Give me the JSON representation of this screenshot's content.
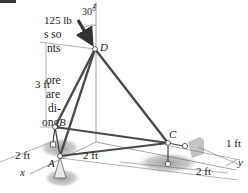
{
  "figure": {
    "force_label": "125 lb",
    "angle_label": "30°",
    "points": {
      "A": "A",
      "B": "B",
      "C": "C",
      "D": "D"
    },
    "axes": {
      "x": "x",
      "y": "y",
      "z": "z"
    },
    "dimensions": {
      "height": "3 ft",
      "ab_offset": "2 ft",
      "ac_span": "2 ft",
      "c_offset": "1 ft",
      "c_depth": "2 ft"
    }
  },
  "side_text": {
    "lines": [
      "s so",
      "nts",
      "",
      "ore",
      "are",
      "di-",
      "ong"
    ]
  },
  "colors": {
    "member": "#4a4a4a",
    "line": "#555555",
    "shade": "#9a9a9a",
    "text": "#222222"
  }
}
